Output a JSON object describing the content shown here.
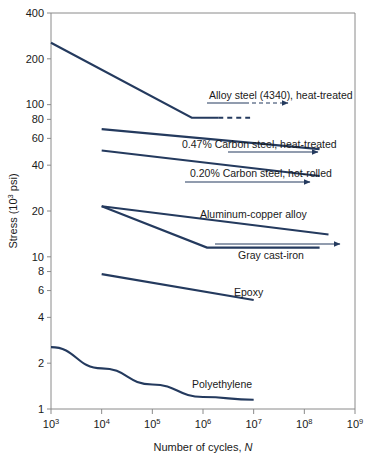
{
  "chart_data": {
    "type": "line",
    "title": "",
    "xlabel": "Number of cycles, N",
    "xlabel_plain": "Number of cycles,",
    "xlabel_italic": "N",
    "ylabel": "Stress (10^3 psi)",
    "ylabel_prefix": "Stress (10",
    "ylabel_exponent": "3",
    "ylabel_suffix": " psi)",
    "xscale": "log",
    "yscale": "log",
    "xlim": [
      1000,
      1000000000
    ],
    "ylim": [
      1,
      400
    ],
    "grid": false,
    "legend": "inline-annotations",
    "xticks": [
      {
        "value": 1000,
        "base": "10",
        "exp": "3"
      },
      {
        "value": 10000,
        "base": "10",
        "exp": "4"
      },
      {
        "value": 100000,
        "base": "10",
        "exp": "5"
      },
      {
        "value": 1000000,
        "base": "10",
        "exp": "6"
      },
      {
        "value": 10000000,
        "base": "10",
        "exp": "7"
      },
      {
        "value": 100000000,
        "base": "10",
        "exp": "8"
      },
      {
        "value": 1000000000,
        "base": "10",
        "exp": "9"
      }
    ],
    "yticks": [
      {
        "value": 400,
        "label": "400"
      },
      {
        "value": 200,
        "label": "200"
      },
      {
        "value": 100,
        "label": "100"
      },
      {
        "value": 80,
        "label": "80"
      },
      {
        "value": 60,
        "label": "60"
      },
      {
        "value": 40,
        "label": "40"
      },
      {
        "value": 20,
        "label": "20"
      },
      {
        "value": 10,
        "label": "10"
      },
      {
        "value": 8,
        "label": "8"
      },
      {
        "value": 6,
        "label": "6"
      },
      {
        "value": 4,
        "label": "4"
      },
      {
        "value": 2,
        "label": "2"
      },
      {
        "value": 1,
        "label": "1"
      }
    ],
    "line_color": "#243a5e",
    "axis_color": "#8a8a8a",
    "series": [
      {
        "name": "Alloy steel (4340), heat-treated",
        "points": [
          [
            1000,
            255
          ],
          [
            600000,
            82
          ],
          [
            2000000,
            82
          ]
        ],
        "dashed_tail": [
          [
            2000000,
            82
          ],
          [
            8500000,
            82
          ]
        ],
        "has_arrow": true,
        "label_x": 9000000,
        "label_y": 104,
        "label_anchor": "middle"
      },
      {
        "name": "0.47% Carbon steel, heat-treated",
        "points": [
          [
            10000,
            69
          ],
          [
            200000000,
            51
          ]
        ],
        "dashed_tail": null,
        "has_arrow": false,
        "label_x": 9000000,
        "label_y": 62,
        "label_anchor": "middle"
      },
      {
        "name": "0.20% Carbon steel, hot-rolled",
        "points": [
          [
            10000,
            50
          ],
          [
            200000000,
            34
          ]
        ],
        "dashed_tail": null,
        "has_arrow": false,
        "label_x": 9000000,
        "label_y": 43,
        "label_anchor": "middle"
      },
      {
        "name": "Aluminum-copper alloy",
        "points": [
          [
            10000,
            21.5
          ],
          [
            300000000,
            14
          ]
        ],
        "dashed_tail": null,
        "has_arrow": false,
        "label_x": 3000000,
        "label_y": 22,
        "label_anchor": "middle"
      },
      {
        "name": "Gray cast-iron",
        "points": [
          [
            10000,
            21.5
          ],
          [
            1200000,
            11.5
          ],
          [
            200000000,
            11.5
          ]
        ],
        "dashed_tail": null,
        "has_arrow": false,
        "label_x": 6000000,
        "label_y": 10.2,
        "label_anchor": "middle"
      },
      {
        "name": "Epoxy",
        "points": [
          [
            10000,
            7.7
          ],
          [
            10000000,
            5.2
          ]
        ],
        "dashed_tail": null,
        "has_arrow": false,
        "label_x": 20000000,
        "label_y": 6.3,
        "label_anchor": "middle"
      },
      {
        "name": "Polyethylene",
        "points": [
          [
            1000,
            2.55
          ],
          [
            10000,
            1.85
          ],
          [
            100000,
            1.45
          ],
          [
            1000000,
            1.2
          ],
          [
            10000000,
            1.15
          ]
        ],
        "dashed_tail": null,
        "has_arrow": false,
        "label_x": 3000000,
        "label_y": 1.6,
        "label_anchor": "middle"
      }
    ],
    "annotations": [
      {
        "text": "Alloy steel (4340), heat-treated",
        "leader_from": [
          207,
          103
        ],
        "leader_to": [
          288,
          103
        ],
        "leader_dashed_from": [
          245,
          103
        ],
        "arrow_at": [
          288,
          103
        ],
        "text_x": 209,
        "text_y": 99,
        "anchor": "start"
      },
      {
        "text": "0.47% Carbon steel, heat-treated",
        "leader_from": [
          228,
          152
        ],
        "leader_to": [
          318,
          152
        ],
        "arrow_at": [
          318,
          152
        ],
        "text_x": 182,
        "text_y": 148,
        "anchor": "start"
      },
      {
        "text": "0.20% Carbon steel, hot-rolled",
        "leader_from": [
          185,
          182
        ],
        "leader_to": [
          310,
          182
        ],
        "arrow_at": [
          310,
          182
        ],
        "text_x": 190,
        "text_y": 177,
        "anchor": "start"
      },
      {
        "text": "Aluminum-copper alloy",
        "text_x": 200,
        "text_y": 218,
        "anchor": "start"
      },
      {
        "text": "Gray cast-iron",
        "leader_from": [
          215,
          244
        ],
        "leader_to": [
          340,
          244
        ],
        "arrow_at": [
          340,
          244
        ],
        "text_x": 238,
        "text_y": 259,
        "anchor": "start"
      },
      {
        "text": "Epoxy",
        "text_x": 234,
        "text_y": 296,
        "anchor": "start"
      },
      {
        "text": "Polyethylene",
        "text_x": 192,
        "text_y": 388,
        "anchor": "start"
      }
    ]
  }
}
